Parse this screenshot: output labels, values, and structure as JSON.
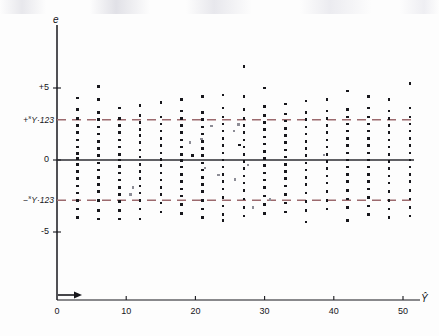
{
  "chart_data": {
    "type": "scatter",
    "title": "",
    "subtitle": "",
    "xlabel": "Ŷ",
    "ylabel": "e",
    "xlabel_plain": "Y-hat",
    "ylabel_plain": "e",
    "xlim": [
      0,
      53
    ],
    "ylim": [
      -9.5,
      9.0
    ],
    "xticks": [
      0,
      10,
      20,
      30,
      40,
      50
    ],
    "xtick_labels": [
      "0",
      "10",
      "20",
      "30",
      "40",
      "50"
    ],
    "yticks": [
      5,
      0,
      -5
    ],
    "ytick_labels": [
      "+5",
      "0",
      "-5"
    ],
    "grid": false,
    "legend": null,
    "axis_break_marker": "arrow on x-axis between 0 and 3",
    "reference_lines": [
      {
        "name": "zero-line",
        "value": 0,
        "style": "solid",
        "color": "#2b2b31",
        "label": ""
      },
      {
        "name": "upper-band",
        "value": 2.8,
        "style": "dashed",
        "color": "#9c6a6e",
        "label_sup": "s",
        "label_main": "Y·123",
        "label_sign": "+"
      },
      {
        "name": "lower-band",
        "value": -2.8,
        "style": "dashed",
        "color": "#9c6a6e",
        "label_sup": "s",
        "label_main": "Y·123",
        "label_sign": "−"
      }
    ],
    "columns": [
      {
        "x": 3,
        "values": [
          4.3,
          3.5,
          2.9,
          2.4,
          1.9,
          1.4,
          0.9,
          0.45,
          0.1,
          -0.3,
          -0.8,
          -1.3,
          -1.8,
          -2.3,
          -2.8,
          -3.4,
          -4.0
        ]
      },
      {
        "x": 6,
        "values": [
          5.1,
          4.2,
          3.3,
          2.8,
          2.3,
          1.8,
          1.3,
          0.8,
          0.3,
          -0.2,
          -0.7,
          -1.2,
          -1.7,
          -2.2,
          -2.8,
          -3.5,
          -4.1
        ]
      },
      {
        "x": 9,
        "values": [
          3.6,
          2.9,
          2.4,
          1.9,
          1.4,
          0.9,
          0.4,
          0.0,
          -0.45,
          -0.9,
          -1.4,
          -1.9,
          -2.4,
          -2.9,
          -3.5,
          -4.1
        ]
      },
      {
        "x": 12,
        "values": [
          3.8,
          3.1,
          2.6,
          2.1,
          1.7,
          1.2,
          0.7,
          0.2,
          -0.3,
          -0.8,
          -1.3,
          -1.8,
          -2.3,
          -2.8,
          -3.4,
          -4.1
        ]
      },
      {
        "x": 15,
        "values": [
          4.0,
          3.0,
          2.5,
          2.0,
          1.5,
          1.0,
          0.5,
          0.05,
          -0.4,
          -0.9,
          -1.4,
          -1.9,
          -2.4,
          -3.0,
          -3.6
        ]
      },
      {
        "x": 18,
        "values": [
          4.2,
          3.4,
          2.9,
          2.4,
          1.9,
          1.4,
          0.9,
          0.4,
          -0.05,
          -0.5,
          -1.0,
          -1.5,
          -2.0,
          -2.5,
          -3.1,
          -3.7
        ]
      },
      {
        "x": 21,
        "values": [
          4.4,
          3.3,
          2.8,
          2.3,
          1.8,
          1.3,
          0.8,
          0.3,
          -0.2,
          -0.7,
          -1.2,
          -1.7,
          -2.2,
          -2.8,
          -3.4,
          -4.0
        ]
      },
      {
        "x": 24,
        "values": [
          4.5,
          3.6,
          3.0,
          2.5,
          2.0,
          1.5,
          1.0,
          0.5,
          0.0,
          -0.5,
          -1.0,
          -1.5,
          -2.0,
          -2.6,
          -3.2,
          -3.8,
          -4.2
        ]
      },
      {
        "x": 27,
        "values": [
          6.5,
          4.4,
          3.5,
          2.9,
          2.4,
          1.9,
          1.4,
          0.9,
          0.4,
          -0.1,
          -0.6,
          -1.1,
          -1.6,
          -2.1,
          -2.7,
          -3.3,
          -3.9
        ]
      },
      {
        "x": 30,
        "values": [
          5.0,
          3.7,
          3.1,
          2.6,
          2.1,
          1.6,
          1.1,
          0.6,
          0.1,
          -0.4,
          -0.9,
          -1.4,
          -1.9,
          -2.5,
          -3.1,
          -3.7
        ]
      },
      {
        "x": 33,
        "values": [
          3.9,
          3.2,
          2.7,
          2.2,
          1.7,
          1.2,
          0.7,
          0.2,
          -0.3,
          -0.8,
          -1.3,
          -1.8,
          -2.4,
          -3.0,
          -3.6
        ]
      },
      {
        "x": 36,
        "values": [
          4.1,
          3.3,
          2.8,
          2.3,
          1.8,
          1.3,
          0.8,
          0.3,
          -0.2,
          -0.7,
          -1.2,
          -1.7,
          -2.3,
          -2.9,
          -3.5,
          -4.3
        ]
      },
      {
        "x": 39,
        "values": [
          4.2,
          3.4,
          2.9,
          2.4,
          1.9,
          1.4,
          0.9,
          0.4,
          -0.1,
          -0.6,
          -1.1,
          -1.6,
          -2.2,
          -2.8,
          -3.4
        ]
      },
      {
        "x": 42,
        "values": [
          4.8,
          3.5,
          3.0,
          2.5,
          2.0,
          1.5,
          1.0,
          0.5,
          0.0,
          -0.5,
          -1.0,
          -1.5,
          -2.1,
          -2.7,
          -3.3,
          -4.2
        ]
      },
      {
        "x": 45,
        "values": [
          4.4,
          3.6,
          3.0,
          2.5,
          2.0,
          1.5,
          1.0,
          0.5,
          0.0,
          -0.5,
          -1.0,
          -1.5,
          -2.0,
          -2.6,
          -3.2,
          -3.8
        ]
      },
      {
        "x": 48,
        "values": [
          4.2,
          3.4,
          2.9,
          2.4,
          1.9,
          1.4,
          0.9,
          0.4,
          -0.1,
          -0.6,
          -1.1,
          -1.6,
          -2.2,
          -2.8,
          -3.4,
          -4.0
        ]
      },
      {
        "x": 51,
        "values": [
          5.3,
          3.6,
          3.0,
          2.5,
          2.0,
          1.5,
          1.0,
          0.5,
          0.0,
          -0.5,
          -1.0,
          -1.5,
          -2.1,
          -2.7,
          -3.3,
          -3.9
        ]
      }
    ],
    "stray_points": [
      {
        "x": 11.0,
        "y": -1.9,
        "faint": true
      },
      {
        "x": 10.6,
        "y": -2.4,
        "faint": true
      },
      {
        "x": 19.2,
        "y": 1.2,
        "faint": true
      },
      {
        "x": 19.6,
        "y": 0.3,
        "faint": false
      },
      {
        "x": 20.9,
        "y": 1.45,
        "faint": true
      },
      {
        "x": 21.4,
        "y": -0.55,
        "faint": true
      },
      {
        "x": 22.3,
        "y": 2.35,
        "faint": true
      },
      {
        "x": 23.3,
        "y": -1.05,
        "faint": true
      },
      {
        "x": 25.6,
        "y": 2.0,
        "faint": true
      },
      {
        "x": 25.7,
        "y": -1.35,
        "faint": true
      },
      {
        "x": 26.4,
        "y": 1.05,
        "faint": false
      },
      {
        "x": 26.2,
        "y": 2.45,
        "faint": true
      },
      {
        "x": 27.6,
        "y": -0.35,
        "faint": true
      },
      {
        "x": 28.3,
        "y": -3.3,
        "faint": true
      },
      {
        "x": 30.8,
        "y": -2.75,
        "faint": true
      },
      {
        "x": 38.6,
        "y": 0.35,
        "faint": true
      }
    ]
  }
}
